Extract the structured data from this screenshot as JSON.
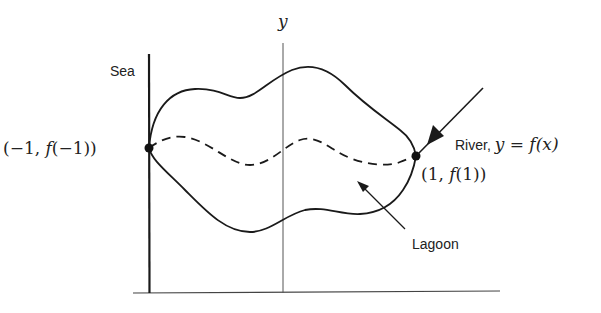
{
  "figure": {
    "axis_label_y": "y",
    "labels": {
      "sea": "Sea",
      "river_text": "River, ",
      "river_eq_y": "y",
      "river_eq_rest": " = ",
      "river_eq_f": "f",
      "river_eq_x": "(x)",
      "left_point_open": "(−1, ",
      "left_point_f": "f",
      "left_point_close": "(−1))",
      "right_point_open": "(1, ",
      "right_point_f": "f",
      "right_point_close": "(1))",
      "lagoon": "Lagoon"
    },
    "colors": {
      "stroke": "#1a1a1a",
      "axis_thin": "#555555",
      "background": "#ffffff"
    },
    "points": [
      {
        "name": "left-endpoint",
        "x": -1,
        "label": "(-1, f(-1))"
      },
      {
        "name": "right-endpoint",
        "x": 1,
        "label": "(1, f(1))"
      }
    ]
  }
}
